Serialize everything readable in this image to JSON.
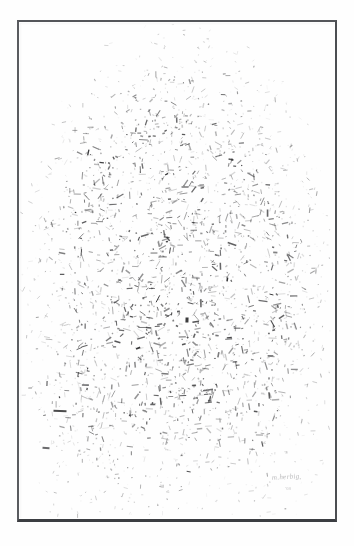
{
  "artwork": {
    "title": "Untitled (mass of short strokes)",
    "medium_appearance": "graphite / ink dash marks on white paper",
    "signature": "m.herbig",
    "signature_date": "'08",
    "background_color": "#ffffff",
    "paper_color": "#fefefe",
    "stroke_color": "#2b2b2d"
  },
  "frame": {
    "border_color_top": "#54565a",
    "border_color_left": "#5a5c60",
    "border_color_right": "#4c4e52",
    "border_color_bottom": "#3c3e42",
    "x": 17,
    "y": 20,
    "width": 320,
    "height": 502,
    "border_width_px": 2
  },
  "composition": {
    "type": "stroke-field",
    "description": "Dense ovoid / dome-shaped mass of thousands of short dash strokes, densest at the center, feathering out at all edges and trailing downward at the bottom.",
    "mass_center_x": 176,
    "mass_center_y": 285,
    "mass_radius_x": 120,
    "mass_radius_y": 215,
    "stroke_count": 5200,
    "stroke_min_length": 1.2,
    "stroke_max_length": 7.5,
    "stroke_min_width": 0.45,
    "stroke_max_width": 1.6,
    "edge_softness": 0.42,
    "bottom_trail_bias": 0.55,
    "top_dome_flatten": 0.88,
    "random_seed": 20080417,
    "accent_strokes": [
      {
        "x": 60,
        "y": 411,
        "length": 13,
        "angle": 2,
        "width": 2.0,
        "alpha": 0.85
      },
      {
        "x": 187,
        "y": 320,
        "length": 5,
        "angle": 92,
        "width": 3.0,
        "alpha": 0.92
      },
      {
        "x": 46,
        "y": 448,
        "length": 7,
        "angle": 4,
        "width": 1.8,
        "alpha": 0.7
      },
      {
        "x": 232,
        "y": 244,
        "length": 9,
        "angle": 18,
        "width": 1.6,
        "alpha": 0.75
      },
      {
        "x": 141,
        "y": 338,
        "length": 8,
        "angle": 164,
        "width": 1.5,
        "alpha": 0.7
      },
      {
        "x": 208,
        "y": 390,
        "length": 10,
        "angle": 172,
        "width": 1.4,
        "alpha": 0.68
      },
      {
        "x": 120,
        "y": 196,
        "length": 8,
        "angle": 150,
        "width": 1.3,
        "alpha": 0.66
      },
      {
        "x": 263,
        "y": 301,
        "length": 9,
        "angle": 8,
        "width": 1.4,
        "alpha": 0.7
      }
    ]
  }
}
